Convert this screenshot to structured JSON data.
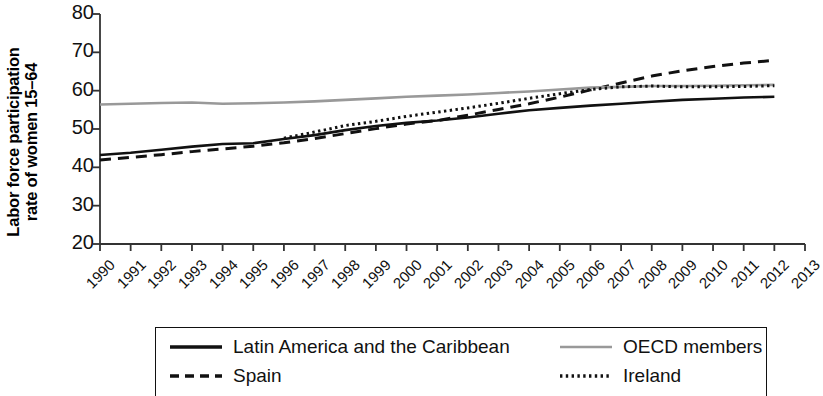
{
  "chart_data": {
    "type": "line",
    "title": "",
    "subtitle": "",
    "xlabel": "",
    "ylabel": "Labor force participation rate of women 15–64",
    "ylabel_lines": [
      "Labor force participation",
      "rate of women 15–64"
    ],
    "xlim": [
      1990,
      2013
    ],
    "ylim": [
      20,
      80
    ],
    "yticks": [
      20,
      30,
      40,
      50,
      60,
      70,
      80
    ],
    "xticks": [
      1990,
      1991,
      1992,
      1993,
      1994,
      1995,
      1996,
      1997,
      1998,
      1999,
      2000,
      2001,
      2002,
      2003,
      2004,
      2005,
      2006,
      2007,
      2008,
      2009,
      2010,
      2011,
      2012,
      2013
    ],
    "grid": false,
    "legend_position": "bottom",
    "x": [
      1990,
      1991,
      1992,
      1993,
      1994,
      1995,
      1996,
      1997,
      1998,
      1999,
      2000,
      2001,
      2002,
      2003,
      2004,
      2005,
      2006,
      2007,
      2008,
      2009,
      2010,
      2011,
      2012
    ],
    "series": [
      {
        "name": "Latin America and the Caribbean",
        "style": "solid",
        "color": "#111111",
        "values": [
          43.2,
          43.8,
          44.6,
          45.4,
          46.1,
          46.3,
          47.4,
          48.4,
          49.7,
          50.8,
          51.6,
          52.2,
          53.0,
          54.0,
          54.9,
          55.5,
          56.1,
          56.6,
          57.1,
          57.6,
          57.9,
          58.2,
          58.4
        ]
      },
      {
        "name": "Spain",
        "style": "dashed",
        "color": "#111111",
        "values": [
          41.9,
          42.6,
          43.3,
          44.1,
          44.8,
          45.5,
          46.4,
          47.5,
          48.8,
          50.1,
          51.3,
          52.2,
          53.6,
          55.1,
          56.6,
          58.3,
          60.2,
          62.0,
          63.8,
          65.2,
          66.3,
          67.2,
          67.9
        ]
      },
      {
        "name": "OECD members",
        "style": "solid",
        "color": "#999999",
        "values": [
          56.4,
          56.6,
          56.8,
          56.9,
          56.6,
          56.7,
          56.9,
          57.2,
          57.6,
          58.0,
          58.4,
          58.7,
          59.0,
          59.4,
          59.8,
          60.3,
          60.8,
          61.0,
          61.2,
          61.2,
          61.3,
          61.4,
          61.5
        ]
      },
      {
        "name": "Ireland",
        "style": "dotted",
        "color": "#111111",
        "values": [
          null,
          null,
          null,
          null,
          null,
          null,
          47.6,
          49.2,
          50.9,
          52.0,
          53.3,
          54.4,
          55.5,
          56.7,
          58.0,
          59.2,
          60.3,
          61.0,
          61.2,
          61.0,
          61.0,
          61.1,
          61.3
        ]
      }
    ],
    "legend": [
      {
        "label": "Latin America and the Caribbean",
        "style": "solid",
        "color": "#111111"
      },
      {
        "label": "OECD members",
        "style": "solid",
        "color": "#999999"
      },
      {
        "label": "Spain",
        "style": "dashed",
        "color": "#111111"
      },
      {
        "label": "Ireland",
        "style": "dotted",
        "color": "#111111"
      }
    ]
  }
}
